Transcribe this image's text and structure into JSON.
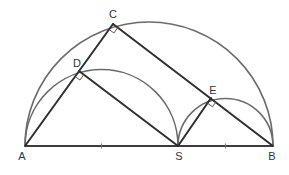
{
  "diagram": {
    "type": "geometry",
    "points": {
      "A": {
        "label": "A",
        "x": 25,
        "y": 146
      },
      "B": {
        "label": "B",
        "x": 273,
        "y": 146
      },
      "S": {
        "label": "S",
        "x": 178,
        "y": 146
      },
      "C": {
        "label": "C",
        "x": 113,
        "y": 24
      },
      "D": {
        "label": "D",
        "x": 79,
        "y": 71
      },
      "E": {
        "label": "E",
        "x": 211,
        "y": 98
      }
    },
    "segments": [
      {
        "from": "A",
        "to": "B"
      },
      {
        "from": "A",
        "to": "C"
      },
      {
        "from": "C",
        "to": "B"
      },
      {
        "from": "D",
        "to": "S"
      },
      {
        "from": "S",
        "to": "E"
      }
    ],
    "semicircles": [
      {
        "diameter": "AB"
      },
      {
        "diameter": "AS"
      },
      {
        "diameter": "SB"
      }
    ],
    "right_angles": [
      "C",
      "D",
      "E"
    ],
    "tick_marks": [
      "midpoint-AS",
      "midpoint-SB"
    ],
    "colors": {
      "arc": "#6b6b6b",
      "segment": "#2f2f2f",
      "label": "#333333",
      "background": "#ffffff"
    }
  }
}
